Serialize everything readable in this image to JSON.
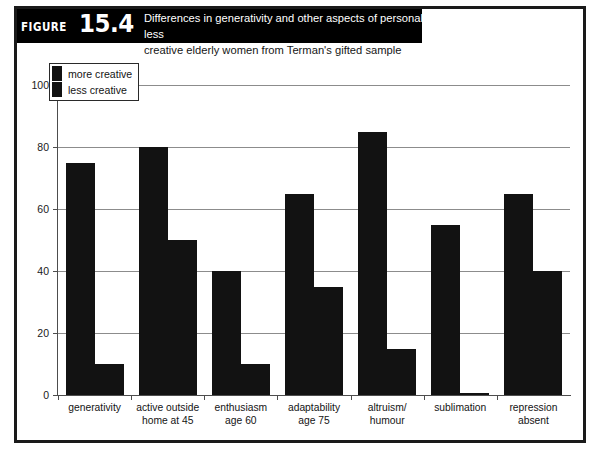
{
  "figure": {
    "tag_word": "FIGURE",
    "tag_number": "15.4",
    "caption_line1": "Differences in generativity and other aspects of personality between highly creative and less",
    "caption_line2": "creative elderly women from Terman's gifted sample"
  },
  "colors": {
    "bar": "#121212",
    "banner": "#000000",
    "grid": "#8c8c8c",
    "axis": "#4d4d4d",
    "frame": "#1a1a1a",
    "page_background": "#ffffff"
  },
  "chart_data": {
    "type": "bar",
    "title": "Differences in generativity and other aspects of personality between highly creative and less creative elderly women from Terman's gifted sample",
    "xlabel": "",
    "ylabel": "",
    "ylim": [
      0,
      100
    ],
    "yticks": [
      0,
      20,
      40,
      60,
      80,
      100
    ],
    "ytick_labels": [
      "0",
      "20",
      "40",
      "60",
      "80",
      "100"
    ],
    "grid": true,
    "legend_position": "top-left",
    "categories": [
      "generativity",
      "active outside home at 45",
      "enthusiasm age 60",
      "adaptability age 75",
      "altruism/ humour",
      "sublimation",
      "repression absent"
    ],
    "category_lines": [
      [
        "generativity"
      ],
      [
        "active outside",
        "home at 45"
      ],
      [
        "enthusiasm",
        "age 60"
      ],
      [
        "adaptability",
        "age 75"
      ],
      [
        "altruism/",
        "humour"
      ],
      [
        "sublimation"
      ],
      [
        "repression",
        "absent"
      ]
    ],
    "series": [
      {
        "name": "more creative",
        "values": [
          75,
          80,
          40,
          65,
          85,
          55,
          65
        ]
      },
      {
        "name": "less creative",
        "values": [
          10,
          50,
          10,
          35,
          15,
          0.5,
          40
        ]
      }
    ]
  },
  "legend": {
    "entries": [
      {
        "label": "more creative"
      },
      {
        "label": "less creative"
      }
    ]
  }
}
